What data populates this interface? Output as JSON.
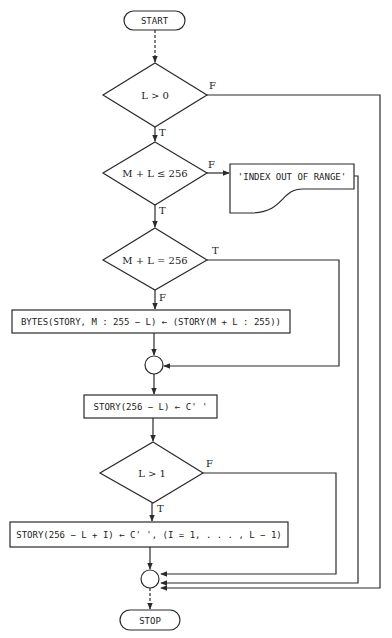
{
  "flowchart": {
    "start": {
      "label": "START"
    },
    "stop": {
      "label": "STOP"
    },
    "decisions": [
      {
        "id": "d1",
        "condition": "L > 0",
        "true_label": "T",
        "false_label": "F"
      },
      {
        "id": "d2",
        "condition": "M + L ≤ 256",
        "true_label": "T",
        "false_label": "F"
      },
      {
        "id": "d3",
        "condition": "M + L = 256",
        "true_label": "T",
        "false_label": "F"
      },
      {
        "id": "d4",
        "condition": "L > 1",
        "true_label": "T",
        "false_label": "F"
      }
    ],
    "output": {
      "label": "'INDEX OUT OF RANGE'"
    },
    "processes": [
      {
        "id": "p1",
        "label": "BYTES(STORY, M : 255 − L) ← (STORY(M + L : 255))"
      },
      {
        "id": "p2",
        "label": "STORY(256 − L) ← C' '"
      },
      {
        "id": "p3",
        "label": "STORY(256 − L + I) ← C' ', (I = 1, . . . , L − 1)"
      }
    ],
    "connectors": [
      {
        "id": "j1",
        "joins": [
          "p1",
          "d3.T"
        ]
      },
      {
        "id": "j2",
        "joins": [
          "p3",
          "d4.F",
          "output",
          "d1.F"
        ]
      }
    ],
    "colors": {
      "stroke": "#2a2a2a",
      "background": "#ffffff"
    }
  }
}
